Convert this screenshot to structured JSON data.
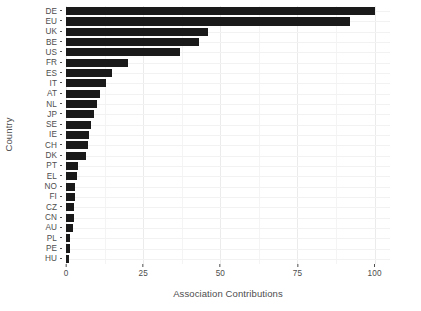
{
  "chart_data": {
    "type": "bar",
    "orientation": "horizontal",
    "title": "",
    "xlabel": "Association Contributions",
    "ylabel": "Country",
    "categories": [
      "DE",
      "EU",
      "UK",
      "BE",
      "US",
      "FR",
      "ES",
      "IT",
      "AT",
      "NL",
      "JP",
      "SE",
      "IE",
      "CH",
      "DK",
      "PT",
      "EL",
      "NO",
      "FI",
      "CZ",
      "CN",
      "AU",
      "PL",
      "PE",
      "HU"
    ],
    "values": [
      100,
      92,
      46,
      43,
      37,
      20,
      15,
      13,
      11,
      10,
      9,
      8,
      7.5,
      7,
      6.5,
      4,
      3.5,
      3,
      2.8,
      2.6,
      2.5,
      2.4,
      1.3,
      1.2,
      1
    ],
    "xlim": [
      0,
      105
    ],
    "xticks": [
      0,
      25,
      50,
      75,
      100
    ],
    "xtick_labels": [
      "0",
      "25",
      "50",
      "75",
      "100"
    ],
    "grid": true,
    "legend": "none",
    "bar_color": "#1a1a1a",
    "panel_background": "#ffffff",
    "gridline_color": "#ebebeb",
    "axis_text_color": "#4d4d4d"
  }
}
